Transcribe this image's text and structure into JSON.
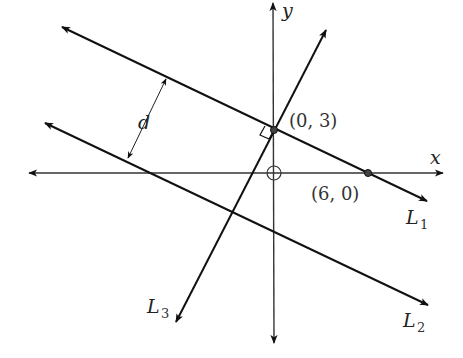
{
  "diagram": {
    "title": "",
    "axes": {
      "x_label": "x",
      "y_label": "y"
    },
    "lines": [
      {
        "name": "L1",
        "label_main": "L",
        "label_sub": "1",
        "description": "line through (0, 3) and (6, 0)"
      },
      {
        "name": "L2",
        "label_main": "L",
        "label_sub": "2",
        "description": "line parallel to L1"
      },
      {
        "name": "L3",
        "label_main": "L",
        "label_sub": "3",
        "description": "line through (0, 3) perpendicular to L1"
      }
    ],
    "points": [
      {
        "label": "(0, 3)"
      },
      {
        "label": "(6, 0)"
      }
    ],
    "distance_label": "d",
    "right_angle_marker": true,
    "origin_marker": "circle-plus"
  }
}
